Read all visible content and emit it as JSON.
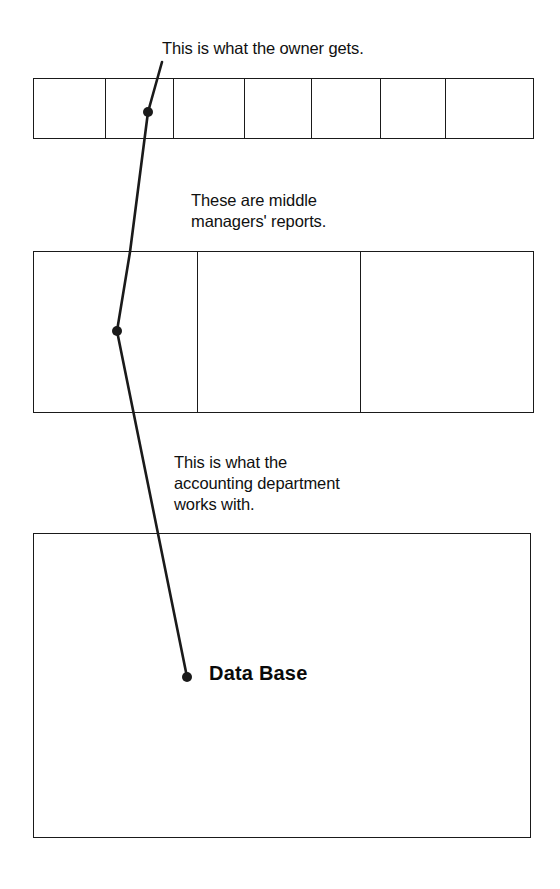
{
  "diagram": {
    "type": "layered-data-aggregation-diagram",
    "background_color": "#ffffff",
    "line_color": "#1a1a1a",
    "text_color": "#101010"
  },
  "captions": {
    "owner": "This is what the owner gets.",
    "middle_managers": "These are middle\nmanagers' reports.",
    "accounting": "This is what the\naccounting department\nworks with."
  },
  "layers": {
    "owner_row": {
      "name": "owner-summary-row",
      "cell_count": 7,
      "cells": [
        "",
        "",
        "",
        "",
        "",
        "",
        ""
      ]
    },
    "middle_row": {
      "name": "middle-managers-row",
      "cell_count": 3,
      "cells": [
        "",
        "",
        ""
      ]
    },
    "database_box": {
      "name": "data-base-box",
      "label": "Data Base"
    }
  },
  "leader_line": {
    "name": "leader-line",
    "points": [
      [
        162,
        62
      ],
      [
        148,
        112
      ],
      [
        130,
        252
      ],
      [
        117,
        331
      ],
      [
        187,
        677
      ]
    ],
    "dots": [
      [
        148,
        112
      ],
      [
        117,
        331
      ],
      [
        187,
        677
      ]
    ],
    "stroke": "#1a1a1a",
    "stroke_width": 2.6,
    "dot_radius": 5
  }
}
